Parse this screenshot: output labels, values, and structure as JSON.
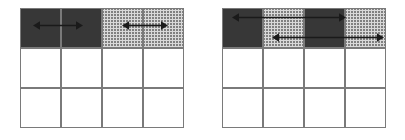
{
  "figure": {
    "title": "",
    "background_color": "#ffffff",
    "grid_line_color": "#7a7a7a",
    "arrow_color": "#1a1a1a",
    "fills": {
      "dark": "#8e8e8e",
      "light": "#d9d9d9",
      "empty": "#ffffff"
    },
    "panels": [
      {
        "name": "left-grid",
        "label": "",
        "x": 20,
        "y": 8,
        "cell_width": 41,
        "cell_height": 40,
        "columns": 4,
        "rows": 3,
        "cells": [
          {
            "row": 0,
            "col": 0,
            "fill": "dark"
          },
          {
            "row": 0,
            "col": 1,
            "fill": "dark"
          },
          {
            "row": 0,
            "col": 2,
            "fill": "light"
          },
          {
            "row": 0,
            "col": 3,
            "fill": "light"
          },
          {
            "row": 1,
            "col": 0,
            "fill": "empty"
          },
          {
            "row": 1,
            "col": 1,
            "fill": "empty"
          },
          {
            "row": 1,
            "col": 2,
            "fill": "empty"
          },
          {
            "row": 1,
            "col": 3,
            "fill": "empty"
          },
          {
            "row": 2,
            "col": 0,
            "fill": "empty"
          },
          {
            "row": 2,
            "col": 1,
            "fill": "empty"
          },
          {
            "row": 2,
            "col": 2,
            "fill": "empty"
          },
          {
            "row": 2,
            "col": 3,
            "fill": "empty"
          }
        ],
        "arrows": [
          {
            "name": "left-grid-dark-span-arrow",
            "label": "",
            "row": 0,
            "from_col": 0,
            "to_col": 1,
            "y_offset": 18,
            "x_start": 33,
            "x_end": 83,
            "style": "double-headed"
          },
          {
            "name": "left-grid-light-span-arrow",
            "label": "",
            "row": 0,
            "from_col": 2,
            "to_col": 3,
            "y_offset": 18,
            "x_start": 122,
            "x_end": 168,
            "style": "double-headed"
          }
        ]
      },
      {
        "name": "right-grid",
        "label": "",
        "x": 222,
        "y": 8,
        "cell_width": 41,
        "cell_height": 40,
        "columns": 4,
        "rows": 3,
        "cells": [
          {
            "row": 0,
            "col": 0,
            "fill": "dark"
          },
          {
            "row": 0,
            "col": 1,
            "fill": "light"
          },
          {
            "row": 0,
            "col": 2,
            "fill": "dark"
          },
          {
            "row": 0,
            "col": 3,
            "fill": "light"
          },
          {
            "row": 1,
            "col": 0,
            "fill": "empty"
          },
          {
            "row": 1,
            "col": 1,
            "fill": "empty"
          },
          {
            "row": 1,
            "col": 2,
            "fill": "empty"
          },
          {
            "row": 1,
            "col": 3,
            "fill": "empty"
          },
          {
            "row": 2,
            "col": 0,
            "fill": "empty"
          },
          {
            "row": 2,
            "col": 1,
            "fill": "empty"
          },
          {
            "row": 2,
            "col": 2,
            "fill": "empty"
          },
          {
            "row": 2,
            "col": 3,
            "fill": "empty"
          }
        ],
        "arrows": [
          {
            "name": "right-grid-upper-span-arrow",
            "label": "",
            "row": 0,
            "from_col": 0,
            "to_col": 2,
            "y_offset": 10,
            "x_start": 232,
            "x_end": 346,
            "style": "double-headed"
          },
          {
            "name": "right-grid-lower-span-arrow",
            "label": "",
            "row": 0,
            "from_col": 1,
            "to_col": 3,
            "y_offset": 30,
            "x_start": 272,
            "x_end": 384,
            "style": "double-headed"
          }
        ]
      }
    ]
  }
}
